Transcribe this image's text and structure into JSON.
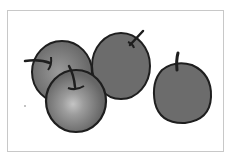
{
  "image": {
    "subject": "four apples illustration",
    "style": "grayscale sketch",
    "apples": [
      {
        "name": "back-left-apple"
      },
      {
        "name": "front-left-apple"
      },
      {
        "name": "center-apple"
      },
      {
        "name": "right-apple"
      }
    ]
  },
  "colors": {
    "background": "#ffffff",
    "frame": "#c8c8c8",
    "apple_fill": "#6e6e6e",
    "apple_outline": "#1e1e1e",
    "highlight": "#b0b0b0"
  }
}
